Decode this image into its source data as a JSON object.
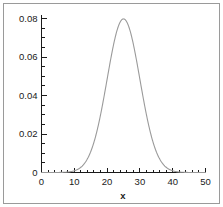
{
  "figure": {
    "background_color": "#ffffff",
    "border_color": "#9a9a9a",
    "axis_color": "#1a1a1a"
  },
  "chart_data": {
    "type": "line",
    "title": "",
    "subtitle": "",
    "xlabel": "x",
    "ylabel": "",
    "xlim": [
      0,
      50
    ],
    "ylim": [
      0,
      0.08
    ],
    "grid": false,
    "legend": null,
    "legend_position": "none",
    "curve_color": "#9a9a9a",
    "distribution": {
      "kind": "normal-pdf",
      "mean": 25,
      "sigma": 5,
      "peak_value": 0.0798,
      "peak_x": 25
    },
    "x_ticks_major": [
      0,
      10,
      20,
      30,
      40,
      50
    ],
    "x_tick_labels": [
      "0",
      "10",
      "20",
      "30",
      "40",
      "50"
    ],
    "x_tick_minor_step": 2,
    "y_ticks_major": [
      0,
      0.02,
      0.04,
      0.06,
      0.08
    ],
    "y_tick_labels": [
      "0",
      "0.02",
      "0.04",
      "0.06",
      "0.08"
    ],
    "y_tick_minor_step": 0.005,
    "x": [
      0,
      1,
      2,
      3,
      4,
      5,
      6,
      7,
      8,
      9,
      10,
      11,
      12,
      13,
      14,
      15,
      16,
      17,
      18,
      19,
      20,
      21,
      22,
      23,
      24,
      25,
      26,
      27,
      28,
      29,
      30,
      31,
      32,
      33,
      34,
      35,
      36,
      37,
      38,
      39,
      40,
      41,
      42,
      43,
      44,
      45,
      46,
      47,
      48,
      49,
      50
    ],
    "values": [
      0.0,
      0.0,
      0.0,
      0.0,
      0.0,
      0.0,
      0.0,
      0.0001,
      0.0001,
      0.0002,
      0.0004,
      0.0008,
      0.0014,
      0.0022,
      0.0035,
      0.0054,
      0.0079,
      0.0111,
      0.0149,
      0.0194,
      0.0242,
      0.029,
      0.0333,
      0.0368,
      0.0391,
      0.0399,
      0.0391,
      0.0368,
      0.0333,
      0.029,
      0.0242,
      0.0194,
      0.0149,
      0.0111,
      0.0079,
      0.0054,
      0.0035,
      0.0022,
      0.0014,
      0.0008,
      0.0004,
      0.0002,
      0.0001,
      0.0001,
      0.0,
      0.0,
      0.0,
      0.0,
      0.0,
      0.0,
      0.0
    ]
  }
}
